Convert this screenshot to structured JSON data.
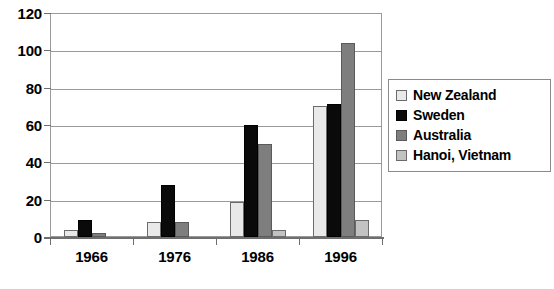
{
  "chart_data": {
    "type": "bar",
    "title": "",
    "subtitle": "",
    "xlabel": "",
    "ylabel": "",
    "categories": [
      "1966",
      "1976",
      "1986",
      "1996"
    ],
    "series": [
      {
        "name": "New Zealand",
        "color": "#e9e9e9",
        "values": [
          4,
          8,
          19,
          70
        ]
      },
      {
        "name": "Sweden",
        "color": "#0a0a0a",
        "values": [
          9,
          28,
          60,
          71
        ]
      },
      {
        "name": "Australia",
        "color": "#7e7e7e",
        "values": [
          2,
          8,
          50,
          104
        ]
      },
      {
        "name": "Hanoi, Vietnam",
        "color": "#c2c2c2",
        "values": [
          0,
          0,
          4,
          9
        ]
      }
    ],
    "ylim": [
      0,
      120
    ],
    "ytick_values": [
      0,
      20,
      40,
      60,
      80,
      100,
      120
    ],
    "ytick_labels": [
      "0",
      "20",
      "40",
      "60",
      "80",
      "100",
      "120"
    ],
    "grid": true,
    "grid_axis": "y",
    "legend_position": "right",
    "plot_background": "#ffffff",
    "axis_color": "#6e6e6e",
    "gridline_color": "#9a9a9a"
  }
}
